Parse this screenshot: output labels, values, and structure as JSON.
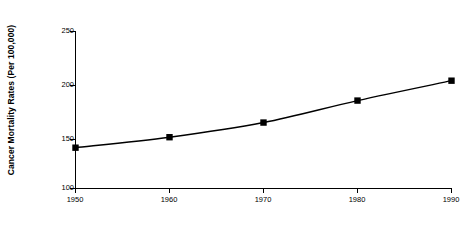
{
  "chart_data": {
    "type": "line",
    "title": "",
    "xlabel": "Year",
    "ylabel": "Cancer Mortality Rates (Per 100,000)",
    "x": [
      1950,
      1960,
      1970,
      1980,
      1990
    ],
    "values": [
      139,
      149,
      163,
      184,
      203
    ],
    "categories": [
      "1950",
      "1960",
      "1970",
      "1980",
      "1990"
    ],
    "xlim": [
      1950,
      1990
    ],
    "ylim": [
      100,
      250
    ],
    "yticks": [
      100,
      150,
      200,
      250
    ],
    "ytick_labels": [
      "100",
      "150",
      "200",
      "250"
    ],
    "xticks": [
      1950,
      1960,
      1970,
      1980,
      1990
    ],
    "xtick_labels": [
      "1950",
      "1960",
      "1970",
      "1980",
      "1990"
    ],
    "grid": false,
    "legend": "none",
    "series": [
      {
        "name": "Cancer Mortality Rate",
        "values": [
          139,
          149,
          163,
          184,
          203
        ],
        "marker": "square",
        "marker_color": "#000000",
        "line_color": "#000000"
      }
    ],
    "colors": {
      "line": "#000000",
      "marker": "#000000",
      "axis": "#000000",
      "background": "#ffffff",
      "text": "#000000"
    }
  }
}
